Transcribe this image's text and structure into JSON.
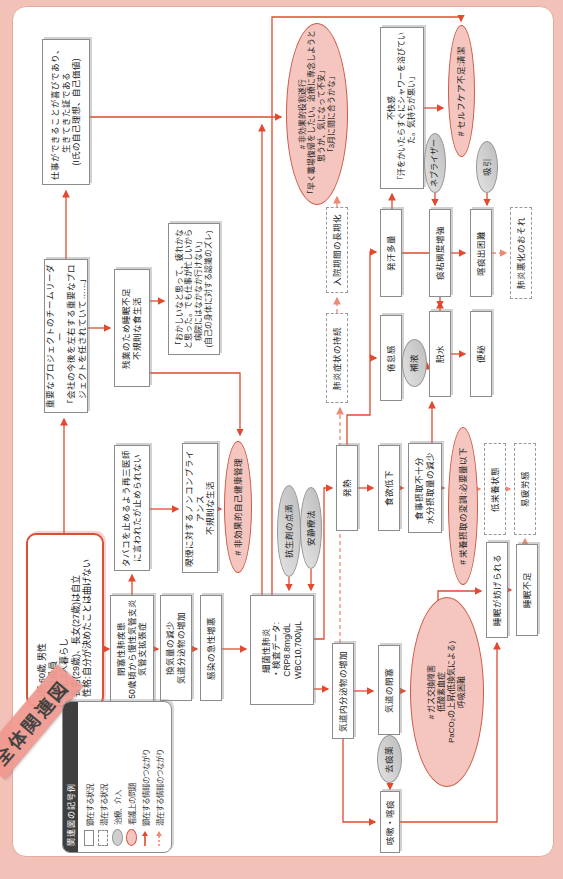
{
  "title": "全体関連図",
  "legend": {
    "header": "関連図の記号例",
    "items": [
      {
        "symbol": "solid-box",
        "label": "顕在する状況"
      },
      {
        "symbol": "dashed-box",
        "label": "潜在する状況"
      },
      {
        "symbol": "gray-ellipse",
        "label": "治療、介入"
      },
      {
        "symbol": "pink-ellipse",
        "label": "看護上の問題"
      },
      {
        "symbol": "solid-arrow",
        "label": "顕在する情報のつながり"
      },
      {
        "symbol": "dashed-arrow",
        "label": "潜在する情報のつながり"
      }
    ]
  },
  "colors": {
    "page_background": "#f2c1b8",
    "panel_border": "#e7aba1",
    "solid_arrow": "#e2492f",
    "latent_arrow": "#ed8a77",
    "problem_ellipse": "#f5c6bf",
    "treatment_ellipse": "#cfcfcf",
    "patient_border": "#d94f3a",
    "tape": "#ef9a90"
  },
  "nodes": {
    "patient": {
      "text": "I氏 60歳 男性\n会社役員\n妻と2人暮らし\n長男(29歳)、長女(27歳)は自立\n性格:自分が決めたことは曲げない"
    },
    "project": {
      "text": "重要なプロジェクトのチームリーダー\n「会社の今後を左右する重要なプロジェクトを任されていて……」"
    },
    "shigoto": {
      "text": "仕事ができることが喜びであり、生きてきた証である\n(I氏の自己理想、自己価値)"
    },
    "zangyou": {
      "text": "残業のため睡眠不足\n不規則な食生活"
    },
    "okashii": {
      "text": "「おかしいなと思って、疲れかなと思った。でも仕事が忙しいから病院にはなかなか行けない」\n(自己の身体に対する認識のズレ)"
    },
    "tabaco": {
      "text": "タバコを止めるよう再三医師に言われたが止められない"
    },
    "kitsuen": {
      "text": "喫煙に対するノンコンプライアンス\n不規則な生活"
    },
    "jikokenkou": {
      "text": "# 非効果的自己健康管理"
    },
    "kousei": {
      "text": "抗生剤の点滴"
    },
    "ansei": {
      "text": "安静療法"
    },
    "heisoku": {
      "text": "閉塞性肺疾患\n50歳頃から慢性気管支炎\n気管支拡張症"
    },
    "kanki": {
      "text": "換気量の減少\n気道分泌物の増加"
    },
    "kansen": {
      "text": "感染の急性増悪"
    },
    "haien": {
      "text": "細菌性肺炎\n・検査データ:\nCRP8.8mg/dL\nWBC10,700/μL"
    },
    "kidobunpi": {
      "text": "気道内分泌物の増加"
    },
    "kidoheisoku": {
      "text": "気道の閉塞"
    },
    "gas": {
      "text": "# ガス交換障害\n低酸素血症\nPaCO₂の上昇(低換気による)\n呼吸困難"
    },
    "gaisou": {
      "text": "咳嗽・喀痰"
    },
    "kyotan": {
      "text": "去痰薬"
    },
    "suimin_samata": {
      "text": "睡眠が妨げられる"
    },
    "suimin_busoku": {
      "text": "睡眠不足"
    },
    "hatsunetsu": {
      "text": "発熱"
    },
    "shokuyoku": {
      "text": "食欲低下"
    },
    "shokuji": {
      "text": "食事摂取不十分\n水分摂取量の減少"
    },
    "eiyou": {
      "text": "# 栄養摂取の変調:必要量以下"
    },
    "teieiyou": {
      "text": "低栄養状態"
    },
    "ihirou": {
      "text": "易疲労感"
    },
    "kentaikan": {
      "text": "倦怠感"
    },
    "hoeki": {
      "text": "補液"
    },
    "dassui": {
      "text": "脱水"
    },
    "benpi": {
      "text": "便秘"
    },
    "haien_shoujou": {
      "text": "肺炎症状の持続"
    },
    "nyuuin": {
      "text": "入院期間の長期化"
    },
    "hakkan": {
      "text": "発汗多量"
    },
    "tannenchou": {
      "text": "痰粘稠度増強"
    },
    "kakutan": {
      "text": "喀痰出困難"
    },
    "haien_akka": {
      "text": "肺炎悪化のおそれ"
    },
    "yakuwari": {
      "text": "# 非効果的役割遂行\n「早く職場復帰をしたい。治療に専念しようと思うが、気になって不安」\n「3月に間に合うかな」"
    },
    "fukaikan": {
      "text": "不快感\n「汗をかいたらすぐにシャワーを浴びていた。気持ちが悪い」"
    },
    "selfcare": {
      "text": "# セルフケア不足:清潔"
    },
    "nebulizer": {
      "text": "ネブライザー"
    },
    "kyuuin": {
      "text": "吸引"
    }
  },
  "connections": [
    {
      "from": "patient",
      "to": "project",
      "style": "solid"
    },
    {
      "from": "patient",
      "to": "heisoku",
      "style": "solid"
    },
    {
      "from": "project",
      "to": "shigoto",
      "style": "solid"
    },
    {
      "from": "project",
      "to": "zangyou",
      "style": "solid"
    },
    {
      "from": "zangyou",
      "to": "okashii",
      "style": "solid"
    },
    {
      "from": "zangyou",
      "to": "jikokenkou",
      "style": "solid"
    },
    {
      "from": "heisoku",
      "to": "tabaco",
      "style": "solid"
    },
    {
      "from": "tabaco",
      "to": "kitsuen",
      "style": "solid"
    },
    {
      "from": "kitsuen",
      "to": "jikokenkou",
      "style": "solid"
    },
    {
      "from": "heisoku",
      "to": "kanki",
      "style": "solid"
    },
    {
      "from": "kanki",
      "to": "kansen",
      "style": "solid"
    },
    {
      "from": "kansen",
      "to": "haien",
      "style": "solid"
    },
    {
      "from": "kousei",
      "to": "haien",
      "style": "solid"
    },
    {
      "from": "ansei",
      "to": "haien",
      "style": "solid"
    },
    {
      "from": "haien",
      "to": "kidobunpi",
      "style": "solid"
    },
    {
      "from": "haien",
      "to": "hatsunetsu",
      "style": "solid"
    },
    {
      "from": "haien",
      "to": "yakuwari",
      "style": "solid"
    },
    {
      "from": "haien",
      "to": "selfcare",
      "style": "solid"
    },
    {
      "from": "kidobunpi",
      "to": "kidoheisoku",
      "style": "solid"
    },
    {
      "from": "kidobunpi",
      "to": "gaisou",
      "style": "solid"
    },
    {
      "from": "kidobunpi",
      "to": "haien_shoujou",
      "style": "dashed"
    },
    {
      "from": "haien_shoujou",
      "to": "nyuuin",
      "style": "dashed"
    },
    {
      "from": "nyuuin",
      "to": "yakuwari",
      "style": "dashed"
    },
    {
      "from": "kidoheisoku",
      "to": "gas",
      "style": "solid"
    },
    {
      "from": "gas",
      "to": "suimin_samata",
      "style": "solid"
    },
    {
      "from": "gaisou",
      "to": "suimin_samata",
      "style": "solid"
    },
    {
      "from": "kyotan",
      "to": "gaisou",
      "style": "solid"
    },
    {
      "from": "suimin_samata",
      "to": "suimin_busoku",
      "style": "solid"
    },
    {
      "from": "suimin_busoku",
      "to": "ihirou",
      "style": "dashed"
    },
    {
      "from": "hatsunetsu",
      "to": "shokuyoku",
      "style": "solid"
    },
    {
      "from": "shokuyoku",
      "to": "shokuji",
      "style": "solid"
    },
    {
      "from": "shokuji",
      "to": "eiyou",
      "style": "solid"
    },
    {
      "from": "shokuji",
      "to": "dassui",
      "style": "solid"
    },
    {
      "from": "eiyou",
      "to": "teieiyou",
      "style": "dashed"
    },
    {
      "from": "teieiyou",
      "to": "ihirou",
      "style": "dashed"
    },
    {
      "from": "hatsunetsu",
      "to": "kentaikan",
      "style": "solid"
    },
    {
      "from": "hatsunetsu",
      "to": "hakkan",
      "style": "solid"
    },
    {
      "from": "hoeki",
      "to": "dassui",
      "style": "solid"
    },
    {
      "from": "hakkan",
      "to": "dassui",
      "style": "solid"
    },
    {
      "from": "dassui",
      "to": "benpi",
      "style": "solid"
    },
    {
      "from": "dassui",
      "to": "tannenchou",
      "style": "solid"
    },
    {
      "from": "tannenchou",
      "to": "kakutan",
      "style": "solid"
    },
    {
      "from": "nebulizer",
      "to": "tannenchou",
      "style": "solid"
    },
    {
      "from": "kyuuin",
      "to": "kakutan",
      "style": "solid"
    },
    {
      "from": "kakutan",
      "to": "haien_akka",
      "style": "dashed"
    },
    {
      "from": "hakkan",
      "to": "fukaikan",
      "style": "solid"
    },
    {
      "from": "fukaikan",
      "to": "selfcare",
      "style": "solid"
    },
    {
      "from": "shigoto",
      "to": "yakuwari",
      "style": "solid"
    }
  ]
}
